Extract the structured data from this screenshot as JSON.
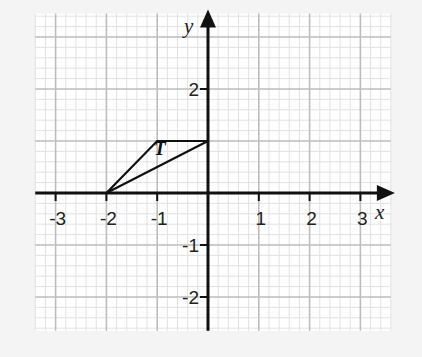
{
  "chart_data": {
    "type": "coordinate-grid",
    "x_axis": {
      "label": "x",
      "ticks": [
        -3,
        -2,
        -1,
        1,
        2,
        3
      ],
      "tick_labels": [
        "-3",
        "-2",
        "-1",
        "1",
        "2",
        "3"
      ],
      "range": [
        -3.4,
        3.6
      ]
    },
    "y_axis": {
      "label": "y",
      "ticks": [
        2,
        -1,
        -2
      ],
      "tick_labels": [
        "2",
        "-1",
        "-2"
      ],
      "range": [
        -2.65,
        3.45
      ]
    },
    "grid": {
      "major_step": 1,
      "minor_subdivisions": 5,
      "visible": true
    },
    "shapes": [
      {
        "name": "T",
        "type": "polygon",
        "vertices": [
          [
            -2,
            0
          ],
          [
            -1,
            1
          ],
          [
            0,
            1
          ]
        ],
        "label": "T",
        "label_position": [
          -0.95,
          0.8
        ]
      }
    ]
  },
  "colors": {
    "background": "#f4f4f4",
    "grid_paper": "#ffffff",
    "minor_grid": "#e2e2e2",
    "major_grid": "#bdbdbd",
    "axis": "#111111",
    "shape": "#111111"
  }
}
